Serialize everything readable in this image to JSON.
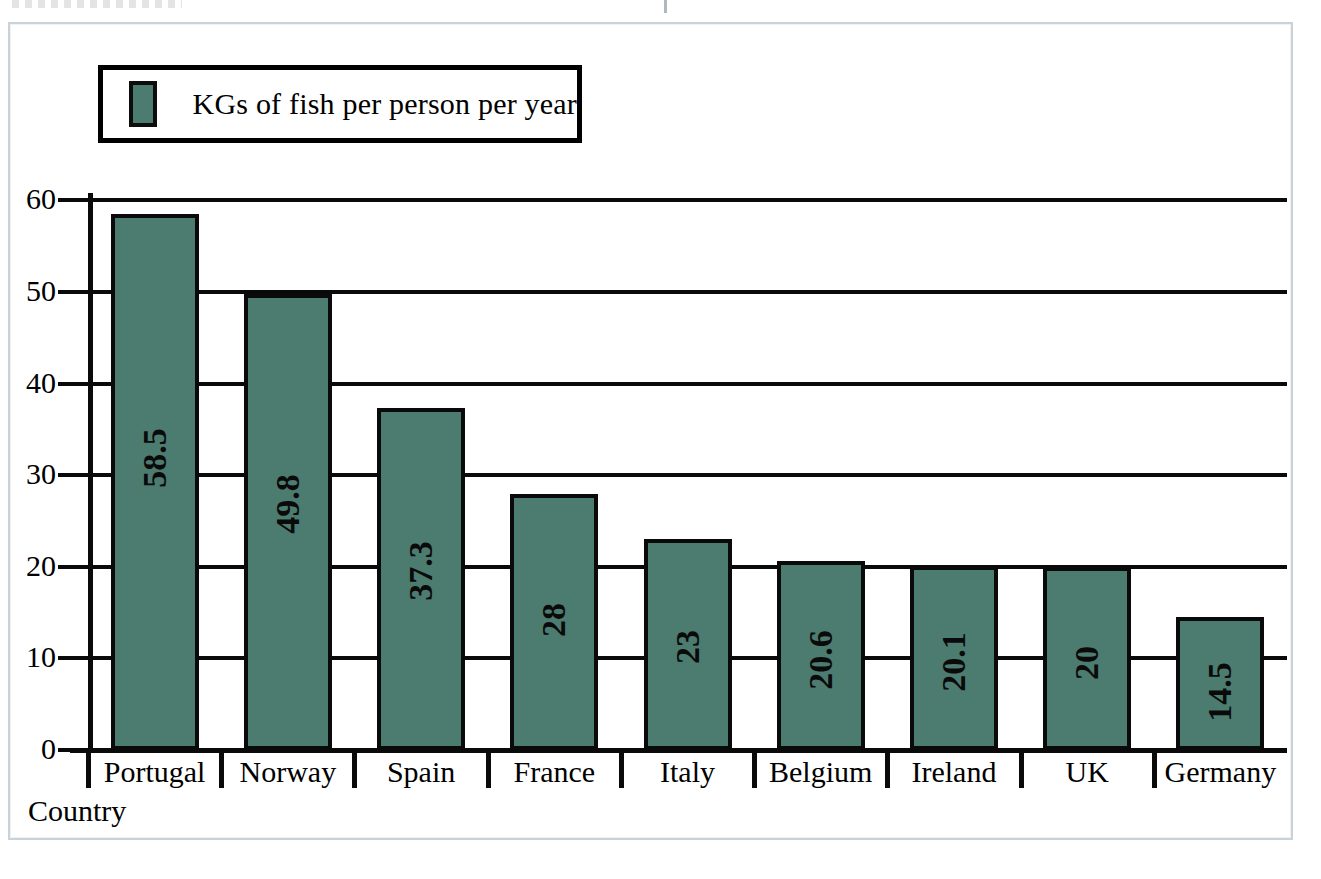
{
  "legend": {
    "label": "KGs of fish per person per year",
    "swatch_color": "#4c7b70"
  },
  "axes": {
    "x_title": "Country",
    "y_ticks": [
      "60",
      "50",
      "40",
      "30",
      "20",
      "10",
      "0"
    ]
  },
  "colors": {
    "bar_fill": "#4c7b70",
    "bar_stroke": "#0a0a0a",
    "gridline": "#0a0a0a",
    "frame": "#c9d2d8",
    "background": "#ffffff"
  },
  "chart_data": {
    "type": "bar",
    "title": "",
    "subtitle": "",
    "xlabel": "Country",
    "ylabel": "",
    "categories": [
      "Portugal",
      "Norway",
      "Spain",
      "France",
      "Italy",
      "Belgium",
      "Ireland",
      "UK",
      "Germany"
    ],
    "values": [
      58.5,
      49.8,
      37.3,
      28,
      23,
      20.6,
      20.1,
      20,
      14.5
    ],
    "value_labels": [
      "58.5",
      "49.8",
      "37.3",
      "28",
      "23",
      "20.6",
      "20.1",
      "20",
      "14.5"
    ],
    "series": [
      {
        "name": "KGs of fish per person per year",
        "values": [
          58.5,
          49.8,
          37.3,
          28,
          23,
          20.6,
          20.1,
          20,
          14.5
        ]
      }
    ],
    "ylim": [
      0,
      60.8
    ],
    "yticks": [
      0,
      10,
      20,
      30,
      40,
      50,
      60
    ],
    "grid": true,
    "grid_axis": "y",
    "legend_position": "top-left",
    "value_label_rotation": -90,
    "value_label_position": "inside"
  }
}
